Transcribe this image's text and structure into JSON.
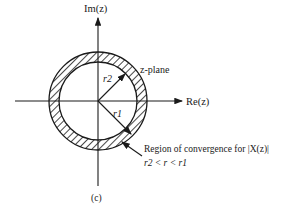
{
  "diagram": {
    "axes": {
      "imaginary_label": "Im(z)",
      "real_label": "Re(z)"
    },
    "plane_label": "z-plane",
    "radii": {
      "outer": "r1",
      "inner": "r2"
    },
    "roc_caption": "Region of convergence for |X(z)|",
    "roc_condition": "r2 < r < r1",
    "subfigure_label": "(c)",
    "colors": {
      "ink": "#1a1a1a",
      "background": "#ffffff"
    }
  }
}
